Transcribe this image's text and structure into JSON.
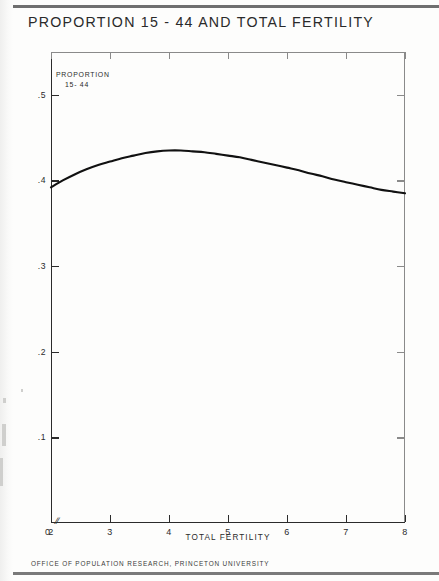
{
  "document": {
    "title": "PROPORTION 15 - 44 AND TOTAL FERTILITY",
    "footer": "OFFICE OF POPULATION RESEARCH, PRINCETON UNIVERSITY"
  },
  "axis_labels": {
    "y_line1": "PROPORTION",
    "y_line2": "15- 44",
    "x": "TOTAL FERTILITY",
    "origin": "0",
    "break_symbol": "//"
  },
  "colors": {
    "ink": "#2b2b2b",
    "frame": "#8a8a8a",
    "curve": "#111111",
    "paper": "#fdfdfc",
    "rule": "#6f6f6f"
  },
  "chart_data": {
    "type": "line",
    "title": "PROPORTION 15 - 44 AND TOTAL FERTILITY",
    "subtitle": "",
    "xlabel": "TOTAL FERTILITY",
    "ylabel": "PROPORTION 15-44",
    "xlim": [
      2,
      8
    ],
    "ylim": [
      0,
      0.55
    ],
    "grid": false,
    "legend": null,
    "axis_break_on_x": true,
    "xticks": [
      2,
      3,
      4,
      5,
      6,
      7,
      8
    ],
    "xtick_labels": [
      "2",
      "3",
      "4",
      "5",
      "6",
      "7",
      "8"
    ],
    "yticks": [
      0.1,
      0.2,
      0.3,
      0.4,
      0.5
    ],
    "ytick_labels": [
      ".1",
      ".2",
      ".3",
      ".4",
      ".5"
    ],
    "series": [
      {
        "name": "Proportion aged 15-44",
        "x": [
          2.0,
          2.2,
          2.4,
          2.6,
          2.8,
          3.0,
          3.2,
          3.4,
          3.6,
          3.8,
          4.0,
          4.2,
          4.4,
          4.6,
          4.8,
          5.0,
          5.2,
          5.4,
          5.6,
          5.8,
          6.0,
          6.2,
          6.4,
          6.6,
          6.8,
          7.0,
          7.2,
          7.4,
          7.6,
          7.8,
          8.0
        ],
        "values": [
          0.392,
          0.4,
          0.407,
          0.413,
          0.418,
          0.422,
          0.426,
          0.429,
          0.432,
          0.434,
          0.435,
          0.435,
          0.434,
          0.433,
          0.431,
          0.429,
          0.427,
          0.424,
          0.421,
          0.418,
          0.415,
          0.412,
          0.408,
          0.405,
          0.401,
          0.398,
          0.395,
          0.392,
          0.389,
          0.387,
          0.385
        ]
      }
    ]
  }
}
